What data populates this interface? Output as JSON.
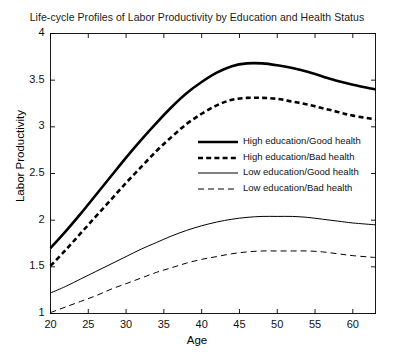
{
  "chart_data": {
    "type": "line",
    "title": "Life-cycle Profiles of Labor Productivity by Education and Health Status",
    "xlabel": "Age",
    "ylabel": "Labor Productivity",
    "xlim": [
      20,
      63
    ],
    "ylim": [
      1,
      4
    ],
    "xticks": [
      20,
      25,
      30,
      35,
      40,
      45,
      50,
      55,
      60
    ],
    "yticks": [
      1,
      1.5,
      2,
      2.5,
      3,
      3.5,
      4
    ],
    "xtick_labels": [
      "20",
      "25",
      "30",
      "35",
      "40",
      "45",
      "50",
      "55",
      "60"
    ],
    "ytick_labels": [
      "1",
      "1.5",
      "2",
      "2.5",
      "3",
      "3.5",
      "4"
    ],
    "grid": false,
    "legend_position": "center-right-inside",
    "x": [
      20,
      22,
      24,
      26,
      28,
      30,
      32,
      34,
      36,
      38,
      40,
      42,
      44,
      46,
      48,
      50,
      52,
      54,
      56,
      58,
      60,
      63
    ],
    "series": [
      {
        "name": "High education/Good health",
        "style": "solid",
        "linewidth": 2.6,
        "color": "#000000",
        "values": [
          1.7,
          1.88,
          2.07,
          2.27,
          2.47,
          2.67,
          2.86,
          3.04,
          3.21,
          3.36,
          3.48,
          3.58,
          3.65,
          3.68,
          3.68,
          3.66,
          3.63,
          3.59,
          3.54,
          3.49,
          3.45,
          3.4
        ]
      },
      {
        "name": "High education/Bad health",
        "style": "dashed",
        "linewidth": 2.6,
        "color": "#000000",
        "values": [
          1.51,
          1.68,
          1.86,
          2.04,
          2.22,
          2.4,
          2.57,
          2.74,
          2.89,
          3.03,
          3.14,
          3.23,
          3.29,
          3.31,
          3.31,
          3.3,
          3.27,
          3.24,
          3.2,
          3.16,
          3.12,
          3.08
        ]
      },
      {
        "name": "Low education/Good health",
        "style": "solid",
        "linewidth": 1,
        "color": "#000000",
        "values": [
          1.22,
          1.29,
          1.37,
          1.45,
          1.53,
          1.61,
          1.69,
          1.76,
          1.83,
          1.89,
          1.94,
          1.98,
          2.01,
          2.03,
          2.04,
          2.04,
          2.04,
          2.03,
          2.01,
          1.99,
          1.97,
          1.95
        ]
      },
      {
        "name": "Low education/Bad health",
        "style": "dashed",
        "linewidth": 1,
        "color": "#000000",
        "values": [
          1.01,
          1.07,
          1.13,
          1.19,
          1.26,
          1.32,
          1.38,
          1.44,
          1.49,
          1.54,
          1.58,
          1.61,
          1.64,
          1.66,
          1.67,
          1.67,
          1.67,
          1.67,
          1.66,
          1.64,
          1.62,
          1.6
        ]
      }
    ]
  },
  "legend": {
    "items": [
      {
        "label": "High education/Good health"
      },
      {
        "label": "High education/Bad health"
      },
      {
        "label": "Low education/Good health"
      },
      {
        "label": "Low education/Bad health"
      }
    ]
  }
}
